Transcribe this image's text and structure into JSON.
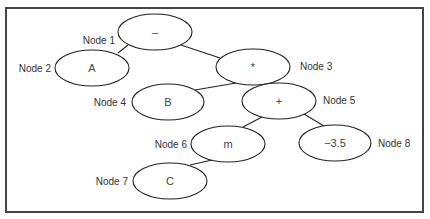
{
  "diagram": {
    "type": "expression-tree",
    "nodes": [
      {
        "id": "node1",
        "label": "Node 1",
        "value": "–"
      },
      {
        "id": "node2",
        "label": "Node 2",
        "value": "A"
      },
      {
        "id": "node3",
        "label": "Node 3",
        "value": "*"
      },
      {
        "id": "node4",
        "label": "Node 4",
        "value": "B"
      },
      {
        "id": "node5",
        "label": "Node 5",
        "value": "+"
      },
      {
        "id": "node6",
        "label": "Node 6",
        "value": "m"
      },
      {
        "id": "node7",
        "label": "Node 7",
        "value": "C"
      },
      {
        "id": "node8",
        "label": "Node 8",
        "value": "−3.5"
      }
    ],
    "edges": [
      {
        "from": "node1",
        "to": "node2"
      },
      {
        "from": "node1",
        "to": "node3"
      },
      {
        "from": "node3",
        "to": "node4"
      },
      {
        "from": "node3",
        "to": "node5"
      },
      {
        "from": "node5",
        "to": "node6"
      },
      {
        "from": "node5",
        "to": "node8"
      },
      {
        "from": "node6",
        "to": "node7"
      }
    ]
  }
}
